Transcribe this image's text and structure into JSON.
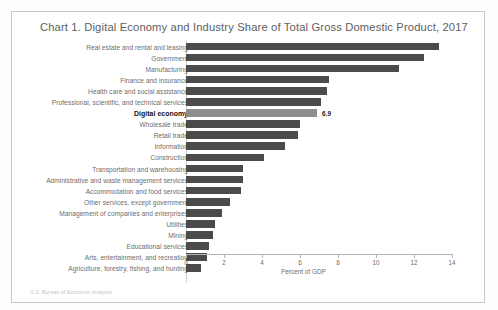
{
  "card": {
    "title": "Chart 1. Digital Economy and Industry Share of Total Gross Domestic Product, 2017",
    "source": "U.S. Bureau of Economic Analysis"
  },
  "axis": {
    "xlabel": "Percent of GDP",
    "ticks": [
      "0",
      "2",
      "4",
      "6",
      "8",
      "10",
      "12",
      "14"
    ]
  },
  "colors": {
    "bar": "#4b4b4b",
    "bar_highlight": "#8e8e8e",
    "card_border": "#c9c9c9",
    "title_text": "#5e5e5e",
    "label_text": "#6d6d6d"
  },
  "chart_data": {
    "type": "bar",
    "orientation": "horizontal",
    "title": "Chart 1. Digital Economy and Industry Share of Total Gross Domestic Product, 2017",
    "xlabel": "Percent of GDP",
    "ylabel": "",
    "xlim": [
      0,
      14
    ],
    "xticks": [
      0,
      2,
      4,
      6,
      8,
      10,
      12,
      14
    ],
    "grid": false,
    "legend": "none",
    "categories": [
      "Real estate and rental and leasing",
      "Government",
      "Manufacturing",
      "Finance and insurance",
      "Health care and social assistance",
      "Professional, scientific, and technical services",
      "Digital economy",
      "Wholesale trade",
      "Retail trade",
      "Information",
      "Construction",
      "Transportation and warehousing",
      "Administrative and waste management services",
      "Accommodation and food services",
      "Other services, except government",
      "Management of companies and enterprises",
      "Utilities",
      "Mining",
      "Educational services",
      "Arts, entertainment, and recreation",
      "Agriculture, forestry, fishing, and hunting"
    ],
    "values": [
      13.3,
      12.5,
      11.2,
      7.5,
      7.4,
      7.1,
      6.9,
      6.0,
      5.9,
      5.2,
      4.1,
      3.0,
      3.0,
      2.9,
      2.3,
      1.9,
      1.5,
      1.4,
      1.2,
      1.1,
      0.8
    ],
    "highlight_category": "Digital economy",
    "data_labels": {
      "Digital economy": "6.9"
    }
  }
}
